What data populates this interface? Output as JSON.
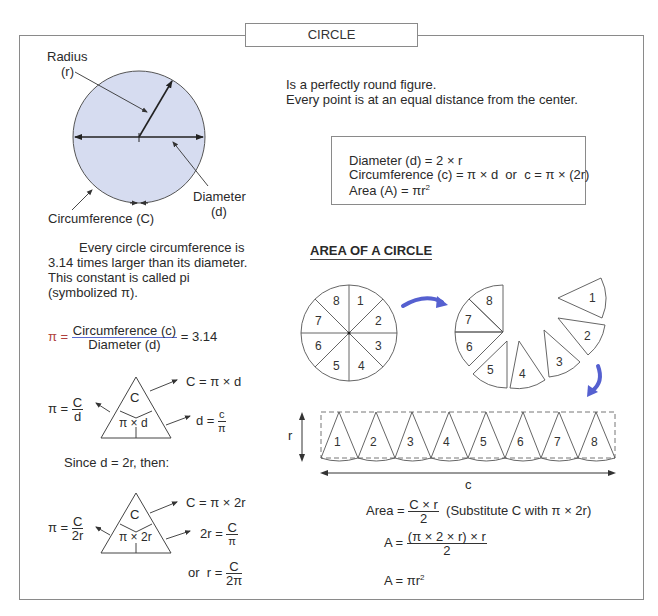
{
  "title": "CIRCLE",
  "intro": {
    "line1": "Is a perfectly round figure.",
    "line2": "Every point is at an equal distance from the center."
  },
  "circle_diagram": {
    "labels": {
      "radius": "Radius",
      "radius_symbol": "(r)",
      "diameter": "Diameter",
      "diameter_symbol": "(d)",
      "circumference": "Circumference (C)"
    },
    "fill_color": "#d6dcf0"
  },
  "formulas": {
    "diameter": "Diameter (d) = 2 × r",
    "circumference": "Circumference (c) = π × d  or  c = π × (2r)",
    "area_prefix": "Area (A) = πr",
    "area_exp": "2"
  },
  "pi_paragraph": "Every circle circumference is 3.14 times larger than its diameter. This constant is called pi (symbolized π).",
  "pi_equation": {
    "lhs": "π =",
    "numerator": "Circumference (c)",
    "denominator": "Diameter (d)",
    "rhs": "= 3.14"
  },
  "triangle1": {
    "top": "C",
    "bottom": "π × d",
    "right_top": "C = π × d",
    "right_bottom_lhs": "d =",
    "right_bottom_num": "c",
    "right_bottom_den": "π",
    "left_lhs": "π =",
    "left_num": "C",
    "left_den": "d"
  },
  "since_text": "Since d = 2r, then:",
  "triangle2": {
    "top": "C",
    "bottom": "π × 2r",
    "right_top": "C = π × 2r",
    "right_mid_lhs": "2r =",
    "right_mid_num": "C",
    "right_mid_den": "π",
    "right_bottom_lhs": "or  r =",
    "right_bottom_num": "C",
    "right_bottom_den": "2π",
    "left_lhs": "π =",
    "left_num": "C",
    "left_den": "2r"
  },
  "area_section": {
    "heading": "AREA OF A CIRCLE",
    "slices": [
      "1",
      "2",
      "3",
      "4",
      "5",
      "6",
      "7",
      "8"
    ],
    "r_label": "r",
    "c_label": "c",
    "arrow_color": "#5560d0"
  },
  "area_derivation": {
    "line1_lhs": "Area =",
    "line1_num": "C × r",
    "line1_den": "2",
    "line1_note": "(Substitute C with π × 2r)",
    "line2_lhs": "A =",
    "line2_num": "(π × 2 × r) × r",
    "line2_den": "2",
    "line3_prefix": "A = πr",
    "line3_exp": "2"
  }
}
